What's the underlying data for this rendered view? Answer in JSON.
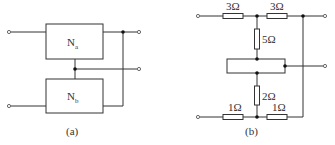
{
  "diagram": {
    "type": "circuit-schematic",
    "panel_a": {
      "caption": "(a)",
      "networks": [
        {
          "name": "N",
          "subscript": "a"
        },
        {
          "name": "N",
          "subscript": "b"
        }
      ]
    },
    "panel_b": {
      "caption": "(b)",
      "resistors": {
        "top_left": "3Ω",
        "top_right": "3Ω",
        "vertical_upper": "5Ω",
        "vertical_lower": "2Ω",
        "bottom_left": "1Ω",
        "bottom_right": "1Ω"
      }
    }
  }
}
